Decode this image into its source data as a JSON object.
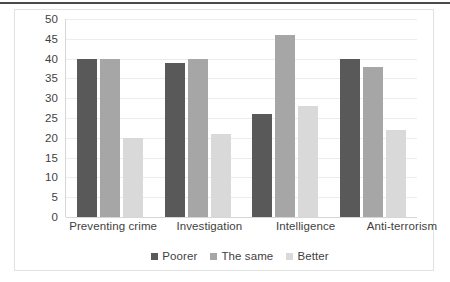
{
  "chart_data": {
    "type": "bar",
    "title": "",
    "subtitle": "",
    "xlabel": "",
    "ylabel": "",
    "ylim": [
      0,
      50
    ],
    "ytick_step": 5,
    "yticks": [
      "50",
      "45",
      "40",
      "35",
      "30",
      "25",
      "20",
      "15",
      "10",
      "5",
      "0"
    ],
    "grid": true,
    "legend_position": "bottom-center",
    "categories": [
      "Preventing crime",
      "Investigation",
      "Intelligence",
      "Anti-terrorism"
    ],
    "series": [
      {
        "name": "Poorer",
        "color": "#595959",
        "values": [
          40,
          39,
          26,
          40
        ]
      },
      {
        "name": "The same",
        "color": "#a6a6a6",
        "values": [
          40,
          40,
          46,
          38
        ]
      },
      {
        "name": "Better",
        "color": "#d9d9d9",
        "values": [
          20,
          21,
          28,
          22
        ]
      }
    ]
  },
  "style": {
    "frame_border_color": "#e2e2e2",
    "gridline_color": "#ececec",
    "axis_color": "#d6d6d6",
    "text_color": "#3f3f3f",
    "background": "#ffffff",
    "top_rule_color": "#4a4a4a"
  }
}
